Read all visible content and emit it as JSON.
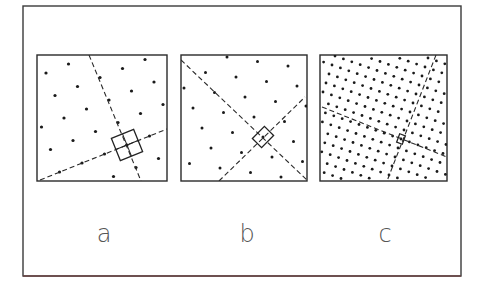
{
  "figure": {
    "width": 482,
    "height": 288,
    "frame": {
      "x": 23,
      "y": 6,
      "width": 438,
      "height": 270
    },
    "colors": {
      "frame": "#3a3a3a",
      "frame_bottom": "#6b4444",
      "panel_border": "#2a2a2a",
      "dot": "#1a1a1a",
      "label": "#555555",
      "background": "#ffffff"
    }
  },
  "panels": [
    {
      "id": "a",
      "label": "a",
      "box": {
        "x": 37,
        "y": 55,
        "width": 130,
        "height": 126
      },
      "label_pos": {
        "x": 104,
        "y": 242
      },
      "lattice": {
        "origin": [
          127,
          145
        ],
        "u": [
          22.5,
          -9.0
        ],
        "v": [
          9.0,
          22.5
        ],
        "dot_radius": 1.6
      },
      "axes": [
        {
          "x1": 89,
          "y1": 55,
          "x2": 141,
          "y2": 181
        },
        {
          "x1": 40,
          "y1": 180,
          "x2": 167,
          "y2": 129
        }
      ],
      "cell": {
        "cx": 127,
        "cy": 145,
        "w": 24,
        "h": 24,
        "angle": -22,
        "cross": true
      }
    },
    {
      "id": "b",
      "label": "b",
      "box": {
        "x": 181,
        "y": 55,
        "width": 126,
        "height": 126
      },
      "label_pos": {
        "x": 247,
        "y": 242
      },
      "lattice": {
        "origin": [
          263,
          137
        ],
        "u": [
          30.5,
          4.5
        ],
        "v": [
          9.0,
          20.0
        ],
        "dot_radius": 1.5
      },
      "axes": [
        {
          "x1": 181,
          "y1": 60,
          "x2": 307,
          "y2": 180
        },
        {
          "x1": 219,
          "y1": 181,
          "x2": 305,
          "y2": 97
        }
      ],
      "cell": {
        "cx": 263,
        "cy": 137,
        "w": 13,
        "h": 17,
        "angle": 45,
        "cross": false
      }
    },
    {
      "id": "c",
      "label": "c",
      "box": {
        "x": 320,
        "y": 55,
        "width": 127,
        "height": 126
      },
      "label_pos": {
        "x": 385,
        "y": 242
      },
      "lattice": {
        "origin": [
          401,
          139
        ],
        "u": [
          8.4,
          2.9
        ],
        "v": [
          -3.0,
          9.0
        ],
        "dot_radius": 1.4
      },
      "axes": [
        {
          "x1": 436,
          "y1": 55,
          "x2": 387,
          "y2": 181
        },
        {
          "x1": 322,
          "y1": 107,
          "x2": 447,
          "y2": 157
        }
      ],
      "cell": {
        "cx": 401,
        "cy": 139,
        "w": 6,
        "h": 9,
        "angle": 20,
        "cross": false
      }
    }
  ]
}
